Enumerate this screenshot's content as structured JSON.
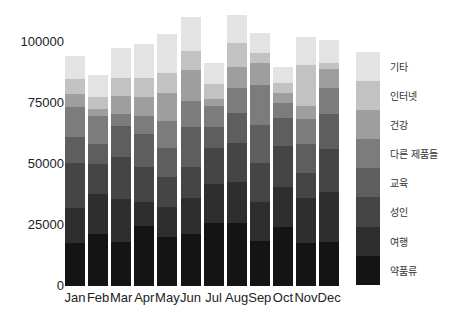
{
  "chart_data": {
    "type": "bar",
    "stacked": true,
    "title": "",
    "xlabel": "",
    "ylabel": "",
    "ylim": [
      0,
      115000
    ],
    "yticks": [
      0,
      25000,
      50000,
      75000,
      100000
    ],
    "ytick_labels": [
      "0",
      "25000",
      "50000",
      "75000",
      "100000"
    ],
    "grid": false,
    "legend_position": "right",
    "categories": [
      "Jan",
      "Feb",
      "Mar",
      "Apr",
      "May",
      "Jun",
      "Jul",
      "Aug",
      "Sep",
      "Oct",
      "Nov",
      "Dec"
    ],
    "series": [
      {
        "name": "약품류",
        "color": "#141414",
        "values": [
          17600,
          21300,
          18000,
          24600,
          20100,
          21300,
          25800,
          25800,
          18400,
          24200,
          17600,
          18000
        ]
      },
      {
        "name": "여행",
        "color": "#2e2e2e",
        "values": [
          14300,
          16400,
          17700,
          9800,
          12300,
          14800,
          16000,
          16800,
          16000,
          16400,
          18500,
          20500
        ]
      },
      {
        "name": "성인",
        "color": "#454545",
        "values": [
          18400,
          12300,
          17200,
          14400,
          12300,
          12700,
          14800,
          16000,
          16000,
          16800,
          10200,
          17600
        ]
      },
      {
        "name": "교육",
        "color": "#5e5e5e",
        "values": [
          10700,
          8200,
          12700,
          13500,
          11900,
          16400,
          8600,
          12300,
          15600,
          11500,
          11900,
          14400
        ]
      },
      {
        "name": "다른 제품들",
        "color": "#7c7c7c",
        "values": [
          12300,
          11500,
          4900,
          7400,
          11000,
          10600,
          8600,
          10200,
          16400,
          6100,
          10200,
          10600
        ]
      },
      {
        "name": "건강",
        "color": "#9e9e9e",
        "values": [
          5300,
          2800,
          7400,
          7800,
          11500,
          12700,
          2800,
          8700,
          9000,
          4100,
          5400,
          7800
        ]
      },
      {
        "name": "인터넷",
        "color": "#c2c2c2",
        "values": [
          6100,
          5000,
          7300,
          7700,
          8200,
          7800,
          6200,
          9800,
          4100,
          4100,
          16800,
          2500
        ]
      },
      {
        "name": "기타",
        "color": "#e3e3e3",
        "values": [
          9400,
          9000,
          12300,
          14000,
          16000,
          13900,
          8600,
          11500,
          8200,
          6600,
          11400,
          9400
        ]
      }
    ],
    "legend_order": [
      "기타",
      "인터넷",
      "건강",
      "다른 제품들",
      "교육",
      "성인",
      "여행",
      "약품류"
    ]
  }
}
